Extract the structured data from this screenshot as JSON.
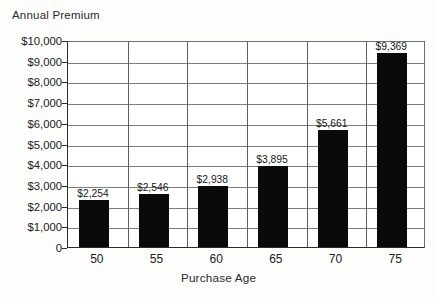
{
  "figure": {
    "caption_partial": "",
    "background_color": "#fdfdfc"
  },
  "chart_data": {
    "type": "bar",
    "title": "",
    "ylabel": "Annual Premium",
    "xlabel": "Purchase Age",
    "categories": [
      "50",
      "55",
      "60",
      "65",
      "70",
      "75"
    ],
    "values": [
      2254,
      2546,
      2938,
      3895,
      5661,
      9369
    ],
    "data_labels": [
      "$2,254",
      "$2,546",
      "$2,938",
      "$3,895",
      "$5,661",
      "$9,369"
    ],
    "ylim": [
      0,
      10000
    ],
    "ytick_values": [
      0,
      1000,
      2000,
      3000,
      4000,
      5000,
      6000,
      7000,
      8000,
      9000,
      10000
    ],
    "ytick_labels": [
      "0",
      "$1,000",
      "$2,000",
      "$3,000",
      "$4,000",
      "$5,000",
      "$6,000",
      "$7,000",
      "$8,000",
      "$9,000",
      "$10,000"
    ],
    "grid": true,
    "grid_axis": "both",
    "legend": false,
    "bar_color": "#0a0a0a",
    "grid_color": "#7d7d7d",
    "axis_color": "#2b2b2b"
  }
}
